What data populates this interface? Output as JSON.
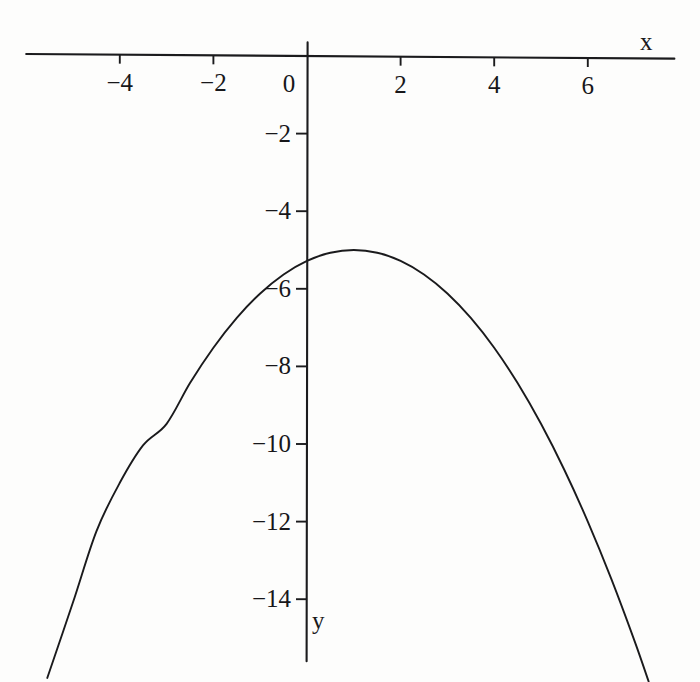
{
  "chart_data": {
    "type": "line",
    "title": "",
    "subtitle": "",
    "xlabel": "x",
    "ylabel": "y",
    "curve_label": "downward parabola",
    "equation": "y = -0.28(x - 1)^2 - 5",
    "vertex": [
      1,
      -5
    ],
    "xlim": [
      -5.8,
      7.8
    ],
    "ylim": [
      -15.6,
      0.3
    ],
    "grid": false,
    "legend": false,
    "legend_position": "none",
    "xticks": [
      -4,
      -2,
      0,
      2,
      4,
      6
    ],
    "xtick_labels": [
      "−4",
      "−2",
      "0",
      "2",
      "4",
      "6"
    ],
    "yticks": [
      -2,
      -4,
      -6,
      -8,
      -10,
      -12,
      -14
    ],
    "ytick_labels": [
      "−2",
      "−4",
      "−6",
      "−8",
      "−10",
      "−12",
      "−14"
    ],
    "series": [
      {
        "name": "parabola",
        "color": "#1a1a1c",
        "x": [
          -5.55,
          -5.0,
          -4.5,
          -4.0,
          -3.5,
          -3.0,
          -2.5,
          -2.0,
          -1.5,
          -1.0,
          -0.5,
          0.0,
          0.5,
          1.0,
          1.5,
          2.0,
          2.5,
          3.0,
          3.5,
          4.0,
          4.5,
          5.0,
          5.5,
          6.0,
          6.5,
          7.0,
          7.3
        ],
        "y": [
          -16.03,
          -14.08,
          -12.25,
          -11.0,
          -10.03,
          -9.48,
          -8.43,
          -7.52,
          -6.75,
          -6.12,
          -5.63,
          -5.28,
          -5.07,
          -5.0,
          -5.07,
          -5.28,
          -5.63,
          -6.12,
          -6.75,
          -7.52,
          -8.43,
          -9.48,
          -10.67,
          -12.0,
          -13.47,
          -15.08,
          -16.12
        ]
      }
    ],
    "axes": {
      "x_axis_from": [
        -6.0,
        0.0
      ],
      "x_axis_to": [
        7.85,
        0.0
      ],
      "y_axis_from": [
        0.0,
        0.35
      ],
      "y_axis_to": [
        0.0,
        -15.6
      ]
    }
  },
  "labels": {
    "x_axis_name": "x",
    "y_axis_name": "y"
  }
}
